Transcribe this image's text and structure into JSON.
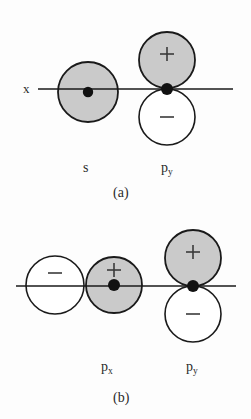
{
  "figure": {
    "background_color": "#fdfdfd",
    "shaded_lobe_color": "#c9c9c9",
    "unshaded_lobe_color": "#ffffff",
    "stroke_color": "#1a1a1a",
    "nucleus_color": "#111111"
  },
  "panels": [
    {
      "id": "a",
      "caption": "(a)",
      "axis_label": "x",
      "orbitals": [
        {
          "name": "s",
          "label": "s",
          "label_base": "s",
          "label_sub": "",
          "lobes": [
            {
              "sign": "",
              "fill": "shaded",
              "cx": 88,
              "cy": 92,
              "r": 30
            }
          ],
          "nucleus": {
            "cx": 88,
            "cy": 92,
            "r": 5
          }
        },
        {
          "name": "py",
          "label": "py",
          "label_base": "p",
          "label_sub": "y",
          "lobes": [
            {
              "sign": "+",
              "fill": "shaded",
              "cx": 167,
              "cy": 60,
              "r": 28
            },
            {
              "sign": "−",
              "fill": "unshaded",
              "cx": 167,
              "cy": 117,
              "r": 28
            }
          ],
          "nucleus": {
            "cx": 167,
            "cy": 89,
            "r": 6
          }
        }
      ],
      "axis": {
        "x1": 38,
        "x2": 233,
        "y": 89
      }
    },
    {
      "id": "b",
      "caption": "(b)",
      "axis_label": "",
      "orbitals": [
        {
          "name": "px",
          "label": "px",
          "label_base": "p",
          "label_sub": "x",
          "lobes": [
            {
              "sign": "−",
              "fill": "unshaded",
              "cx": 55,
              "cy": 285,
              "r": 29
            },
            {
              "sign": "+",
              "fill": "shaded",
              "cx": 114,
              "cy": 285,
              "r": 28
            }
          ],
          "nucleus": {
            "cx": 114,
            "cy": 285,
            "r": 6
          }
        },
        {
          "name": "py",
          "label": "py",
          "label_base": "p",
          "label_sub": "y",
          "lobes": [
            {
              "sign": "+",
              "fill": "shaded",
              "cx": 193,
              "cy": 258,
              "r": 28
            },
            {
              "sign": "−",
              "fill": "unshaded",
              "cx": 193,
              "cy": 314,
              "r": 28
            }
          ],
          "nucleus": {
            "cx": 193,
            "cy": 286,
            "r": 6
          }
        }
      ],
      "axis": {
        "x1": 16,
        "x2": 236,
        "y": 286
      }
    }
  ],
  "labels": {
    "x_axis": "x",
    "s": {
      "base": "s",
      "sub": ""
    },
    "py_a": {
      "base": "p",
      "sub": "y"
    },
    "caption_a": "(a)",
    "px_b": {
      "base": "p",
      "sub": "x"
    },
    "py_b": {
      "base": "p",
      "sub": "y"
    },
    "caption_b": "(b)"
  },
  "signs": {
    "plus": "+",
    "minus": "−"
  }
}
